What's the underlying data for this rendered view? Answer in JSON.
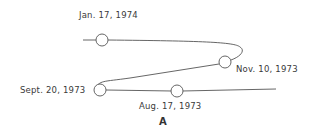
{
  "diagram": {
    "caption": "A",
    "points": [
      {
        "label": "Jan. 17, 1974",
        "x": 102,
        "y": 40
      },
      {
        "label": "Nov. 10, 1973",
        "x": 225,
        "y": 62
      },
      {
        "label": "Sept. 20, 1973",
        "x": 100,
        "y": 90
      },
      {
        "label": "Aug. 17, 1973",
        "x": 177,
        "y": 91
      }
    ],
    "colors": {
      "line": "#555555",
      "text": "#3a3a3a"
    }
  }
}
